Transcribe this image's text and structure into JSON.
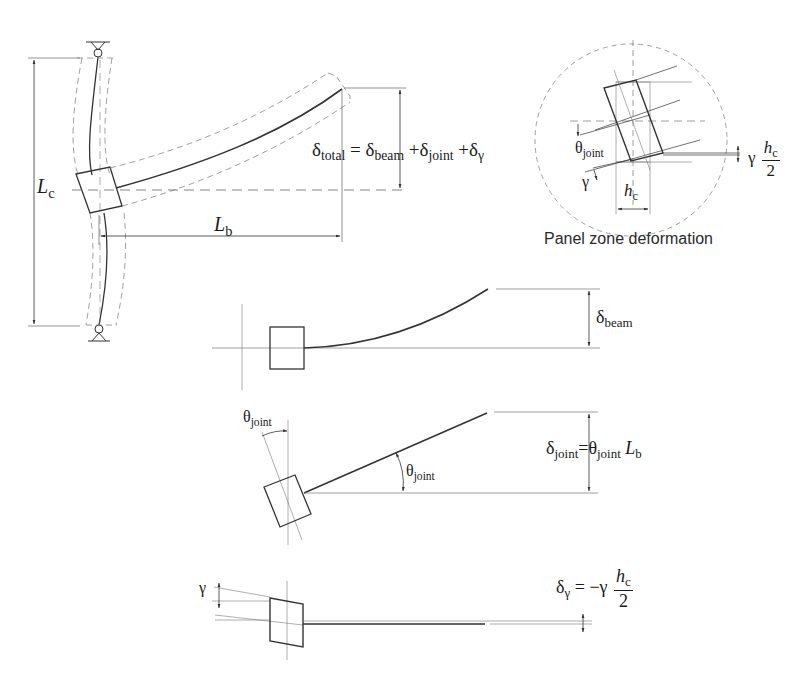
{
  "figure": {
    "main_frame": {
      "column_length_label": "L",
      "column_length_sub": "c",
      "beam_length_label": "L",
      "beam_length_sub": "b",
      "total_eq": {
        "lhs_symbol": "δ",
        "lhs_sub": "total",
        "eq": "=",
        "t1_symbol": "δ",
        "t1_sub": "beam",
        "plus1": "+",
        "t2_symbol": "δ",
        "t2_sub": "joint",
        "plus2": "+",
        "t3_symbol": "δ",
        "t3_sub": "γ"
      }
    },
    "panel_zone": {
      "caption": "Panel zone deformation",
      "theta_symbol": "θ",
      "theta_sub": "joint",
      "gamma": "γ",
      "hc_label": "h",
      "hc_sub": "c",
      "offset_gamma": "γ",
      "offset_num": "h",
      "offset_num_sub": "c",
      "offset_den": "2"
    },
    "beam_component": {
      "symbol": "δ",
      "sub": "beam"
    },
    "joint_component": {
      "theta_top_symbol": "θ",
      "theta_top_sub": "joint",
      "theta_angle_symbol": "θ",
      "theta_angle_sub": "joint",
      "eq_lhs_symbol": "δ",
      "eq_lhs_sub": "joint",
      "eq": "=",
      "eq_theta_symbol": "θ",
      "eq_theta_sub": "joint",
      "eq_L": "L",
      "eq_L_sub": "b"
    },
    "gamma_component": {
      "gamma_label": "γ",
      "eq_lhs_symbol": "δ",
      "eq_lhs_sub": "γ",
      "eq": "=",
      "minus": "−",
      "gamma": "γ",
      "frac_num": "h",
      "frac_num_sub": "c",
      "frac_den": "2"
    }
  }
}
